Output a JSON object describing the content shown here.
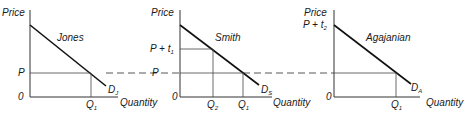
{
  "figure": {
    "type": "tax-incidence-demand-panels",
    "colors": {
      "line": "#111111",
      "axis": "#333333",
      "background": "#ffffff"
    },
    "shared_price_label": "P",
    "dashed_line_label": "P"
  },
  "panels": [
    {
      "name": "Jones",
      "y_axis_label": "Price",
      "x_axis_label": "Quantity",
      "origin_label": "0",
      "price_label": "P",
      "demand_label": "D",
      "demand_sub": "J",
      "q_labels": [
        {
          "main": "Q",
          "sub": "1"
        }
      ]
    },
    {
      "name": "Smith",
      "y_axis_label": "Price",
      "x_axis_label": "Quantity",
      "origin_label": "0",
      "price_label": "P + t",
      "price_sub": "1",
      "demand_label": "D",
      "demand_sub": "S",
      "q_labels": [
        {
          "main": "Q",
          "sub": "2"
        },
        {
          "main": "Q",
          "sub": "1"
        }
      ]
    },
    {
      "name": "Agajanian",
      "y_axis_label": "Price",
      "x_axis_label": "Quantity",
      "origin_label": "0",
      "price_label": "P + t",
      "price_sub": "2",
      "demand_label": "D",
      "demand_sub": "A",
      "q_labels": [
        {
          "main": "Q",
          "sub": "1"
        }
      ]
    }
  ]
}
